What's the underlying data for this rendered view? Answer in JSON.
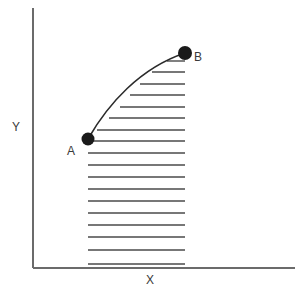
{
  "figure": {
    "width": 301,
    "height": 297,
    "background_color": "#ffffff"
  },
  "axes": {
    "x_label": "X",
    "y_label": "Y",
    "color": "#6b6b6b",
    "line_width": 2,
    "origin": [
      33,
      268
    ],
    "x_end": [
      295,
      268
    ],
    "y_end": [
      33,
      8
    ]
  },
  "points": [
    {
      "name": "A",
      "label": "A",
      "x": 88,
      "y": 139,
      "radius": 6.5,
      "color": "#1a1a1a",
      "label_x": 67,
      "label_y": 145
    },
    {
      "name": "B",
      "label": "B",
      "x": 185,
      "y": 53,
      "radius": 7,
      "color": "#1a1a1a",
      "label_x": 194,
      "label_y": 51
    }
  ],
  "curve": {
    "name": "process-path",
    "color": "#2b2b2b",
    "line_width": 1.6,
    "path": "M 88 139 C 108 104, 140 68, 185 53",
    "description": "concave-down curve from A to B"
  },
  "hatching": {
    "name": "shaded-area-under-curve",
    "color": "#4a4a4a",
    "line_width": 1.4,
    "right_edge_x": 185,
    "left_edge_x": 88,
    "count": 18,
    "lines": [
      {
        "y": 61,
        "x1": 167,
        "x2": 185
      },
      {
        "y": 72,
        "x1": 152,
        "x2": 185
      },
      {
        "y": 84,
        "x1": 140,
        "x2": 185
      },
      {
        "y": 95,
        "x1": 130,
        "x2": 185
      },
      {
        "y": 107,
        "x1": 120,
        "x2": 185
      },
      {
        "y": 118,
        "x1": 109,
        "x2": 185
      },
      {
        "y": 130,
        "x1": 97,
        "x2": 185
      },
      {
        "y": 141,
        "x1": 88,
        "x2": 185
      },
      {
        "y": 153,
        "x1": 88,
        "x2": 185
      },
      {
        "y": 165,
        "x1": 88,
        "x2": 185
      },
      {
        "y": 177,
        "x1": 88,
        "x2": 185
      },
      {
        "y": 189,
        "x1": 88,
        "x2": 185
      },
      {
        "y": 201,
        "x1": 88,
        "x2": 185
      },
      {
        "y": 213,
        "x1": 88,
        "x2": 185
      },
      {
        "y": 225,
        "x1": 88,
        "x2": 185
      },
      {
        "y": 237,
        "x1": 88,
        "x2": 185
      },
      {
        "y": 250,
        "x1": 88,
        "x2": 185
      },
      {
        "y": 264,
        "x1": 88,
        "x2": 185
      }
    ]
  },
  "chart_data": {
    "type": "line",
    "title": "",
    "xlabel": "X",
    "ylabel": "Y",
    "grid": false,
    "legend": "none",
    "annotations": [
      "A",
      "B"
    ],
    "series": [
      {
        "name": "process-path",
        "points": [
          {
            "label": "A",
            "x": 0.21,
            "y": 0.5
          },
          {
            "label": "",
            "x": 0.29,
            "y": 0.63
          },
          {
            "label": "",
            "x": 0.41,
            "y": 0.77
          },
          {
            "label": "B",
            "x": 0.58,
            "y": 0.83
          }
        ]
      }
    ],
    "shaded_region": {
      "name": "area-under-curve-from-A-to-B",
      "hatch": "horizontal",
      "x_from": 0.21,
      "x_to": 0.58,
      "y_from": 0.0
    }
  }
}
